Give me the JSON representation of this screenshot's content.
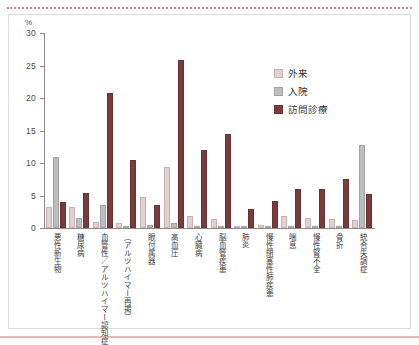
{
  "chart_data": {
    "type": "bar",
    "title": "",
    "xlabel": "",
    "ylabel": "%",
    "ylim": [
      0,
      30
    ],
    "yticks": [
      0,
      5,
      10,
      15,
      20,
      25,
      30
    ],
    "grid": false,
    "legend_position": "top-right",
    "categories": [
      "悪性新生物",
      "糖尿病",
      "血管性／アルツハイマー認知症",
      "（アルツハイマー再掲）",
      "眼付属器",
      "高血圧",
      "心臓病",
      "脳血管疾患",
      "肺炎",
      "慢性閉塞性肺疾患",
      "喘息",
      "慢性腎不全",
      "骨折",
      "統合失調症"
    ],
    "series": [
      {
        "name": "外来",
        "color": "#e3cfce",
        "values": [
          3.3,
          3.2,
          0.9,
          0.7,
          4.7,
          9.4,
          1.9,
          1.4,
          0.2,
          0.4,
          1.9,
          1.6,
          1.4,
          1.2
        ]
      },
      {
        "name": "入院",
        "color": "#bdbdbd",
        "values": [
          11.0,
          1.6,
          3.6,
          0.1,
          0.4,
          0.8,
          0.1,
          0.1,
          0.1,
          0.1,
          0.1,
          0.2,
          0.2,
          12.8
        ]
      },
      {
        "name": "訪問診療",
        "color": "#7c3b3b",
        "values": [
          4.0,
          5.4,
          20.8,
          10.5,
          3.5,
          25.8,
          12.0,
          14.5,
          3.0,
          4.1,
          6.0,
          6.0,
          7.6,
          5.2
        ]
      }
    ]
  },
  "legend": {
    "items": [
      {
        "label": "外来"
      },
      {
        "label": "入院"
      },
      {
        "label": "訪問診療"
      }
    ]
  },
  "axis": {
    "unit": "%"
  }
}
